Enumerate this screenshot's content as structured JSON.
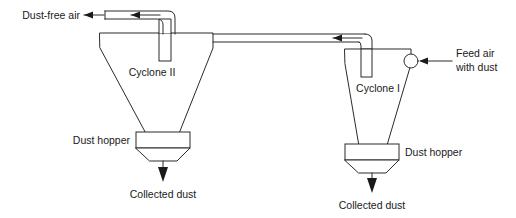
{
  "diagram": {
    "type": "process-flow-diagram",
    "colors": {
      "line": "#2b2b2b",
      "thin_line": "#6a6a6a",
      "text": "#1a1a1a",
      "background": "#ffffff"
    },
    "labels": {
      "dust_free_air": "Dust-free air",
      "cyclone_two": "Cyclone II",
      "cyclone_one": "Cyclone I",
      "feed_air_line1": "Feed air",
      "feed_air_line2": "with dust",
      "dust_hopper_left": "Dust hopper",
      "dust_hopper_right": "Dust hopper",
      "collected_dust_left": "Collected dust",
      "collected_dust_right": "Collected dust"
    },
    "equipment": [
      {
        "id": "cyclone-two",
        "name": "Cyclone II",
        "stage": 2,
        "inlet": "clean-gas-duct-from-cyclone-one",
        "outlet": "dust-free-air",
        "underflow": "dust-hopper-left"
      },
      {
        "id": "cyclone-one",
        "name": "Cyclone I",
        "stage": 1,
        "inlet": "feed-air-with-dust",
        "outlet": "clean-gas-duct-to-cyclone-two",
        "underflow": "dust-hopper-right"
      }
    ],
    "streams": [
      {
        "id": "feed-air",
        "label": "Feed air with dust",
        "direction": "into-cyclone-one"
      },
      {
        "id": "interstage-duct",
        "label": "",
        "direction": "cyclone-one-to-cyclone-two"
      },
      {
        "id": "dust-free-air",
        "label": "Dust-free air",
        "direction": "out-of-cyclone-two"
      },
      {
        "id": "collected-dust-left",
        "label": "Collected dust",
        "direction": "down-from-hopper-left"
      },
      {
        "id": "collected-dust-right",
        "label": "Collected dust",
        "direction": "down-from-hopper-right"
      }
    ]
  }
}
